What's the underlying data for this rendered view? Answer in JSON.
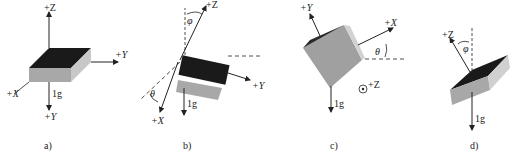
{
  "panels": [
    {
      "caption": "a)",
      "axes": {
        "z": "+Z",
        "y_right": "+Y",
        "x": "+X",
        "y_down": "+Y"
      },
      "gravity": "1g"
    },
    {
      "caption": "b)",
      "axes": {
        "z": "+Z",
        "y": "+Y",
        "x": "+X"
      },
      "angles": {
        "phi": "φ",
        "theta": "θ"
      },
      "gravity": "1g"
    },
    {
      "caption": "c)",
      "axes": {
        "y": "+Y",
        "x": "+X",
        "z": "+Z"
      },
      "angles": {
        "theta": "θ"
      },
      "gravity": "1g"
    },
    {
      "caption": "d)",
      "axes": {
        "z": "+Z"
      },
      "angles": {
        "phi": "φ"
      },
      "gravity": "1g"
    }
  ],
  "colors": {
    "top_face": "#1a1a1a",
    "side_face": "#a8a8a8",
    "light_face": "#cfcfcf",
    "line": "#222222"
  }
}
